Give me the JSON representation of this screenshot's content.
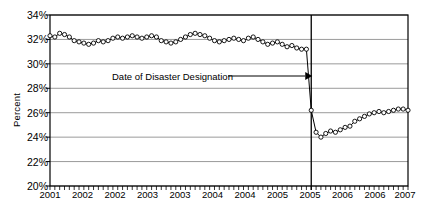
{
  "chart_data": {
    "type": "line",
    "title": "",
    "xlabel": "",
    "ylabel": "Percent",
    "ylim": [
      20,
      34
    ],
    "ytick_labels": [
      "20%",
      "22%",
      "24%",
      "26%",
      "28%",
      "30%",
      "32%",
      "34%"
    ],
    "ytick_values": [
      20,
      22,
      24,
      26,
      28,
      30,
      32,
      34
    ],
    "xtick_labels": [
      "2001",
      "2002",
      "2002",
      "2003",
      "2003",
      "2004",
      "2004",
      "2005",
      "2005",
      "2006",
      "2006",
      "2007"
    ],
    "xtick_positions": [
      0,
      6,
      12,
      18,
      24,
      30,
      36,
      42,
      48,
      54,
      60,
      66
    ],
    "x_minor_ticks": "monthly",
    "grid": "horizontal",
    "legend": "none",
    "marker": "open-circle",
    "line_color": "#000000",
    "grid_color": "#808080",
    "x": [
      0,
      1,
      2,
      3,
      4,
      5,
      6,
      7,
      8,
      9,
      10,
      11,
      12,
      13,
      14,
      15,
      16,
      17,
      18,
      19,
      20,
      21,
      22,
      23,
      24,
      25,
      26,
      27,
      28,
      29,
      30,
      31,
      32,
      33,
      34,
      35,
      36,
      37,
      38,
      39,
      40,
      41,
      42,
      43,
      44,
      45,
      46,
      47,
      48,
      49,
      50,
      51,
      52,
      53,
      54,
      55,
      56,
      57,
      58,
      59,
      60,
      61,
      62,
      63,
      64,
      65,
      66,
      67,
      68,
      69,
      70,
      71,
      72,
      73,
      74
    ],
    "values": [
      32.3,
      32.2,
      32.5,
      32.4,
      32.2,
      31.9,
      31.8,
      31.7,
      31.6,
      31.7,
      31.9,
      31.8,
      31.9,
      32.1,
      32.2,
      32.1,
      32.2,
      32.3,
      32.2,
      32.1,
      32.2,
      32.3,
      32.2,
      31.9,
      31.8,
      31.7,
      31.8,
      32.0,
      32.2,
      32.4,
      32.5,
      32.4,
      32.3,
      32.1,
      31.9,
      31.8,
      31.9,
      32.0,
      32.1,
      32.0,
      31.9,
      32.1,
      32.2,
      32.0,
      31.8,
      31.6,
      31.7,
      31.8,
      31.6,
      31.4,
      31.5,
      31.3,
      31.2,
      31.2,
      26.2,
      24.4,
      24.0,
      24.3,
      24.5,
      24.4,
      24.6,
      24.8,
      24.9,
      25.3,
      25.5,
      25.7,
      25.9,
      26.0,
      26.1,
      26.0,
      26.1,
      26.2,
      26.3,
      26.3,
      26.2
    ],
    "event_line": {
      "label": "Date of Disaster Designation",
      "x_index": 54,
      "color": "#000000"
    }
  },
  "annotation": {
    "text": "Date of Disaster Designation",
    "arrow": "right-arrow-icon"
  }
}
